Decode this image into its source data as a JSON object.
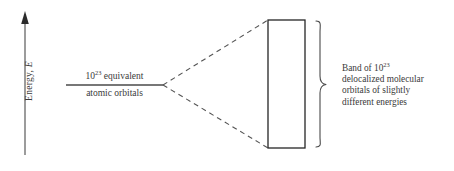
{
  "figure": {
    "axis": {
      "label_prefix": "Energy, ",
      "label_symbol": "E",
      "direction": "up"
    },
    "left_level": {
      "upper_text_prefix": "10",
      "upper_text_exponent": "23",
      "upper_text_suffix": " equivalent",
      "lower_text": "atomic orbitals"
    },
    "band_caption": {
      "line1_prefix": "Band of 10",
      "line1_exponent": "23",
      "line2": "delocalized molecular",
      "line3": "orbitals of slightly",
      "line4": "different energies"
    },
    "colors": {
      "stroke": "#3a3a3a",
      "band_border": "#262626",
      "background": "#ffffff",
      "text": "#3a3a3a"
    }
  }
}
